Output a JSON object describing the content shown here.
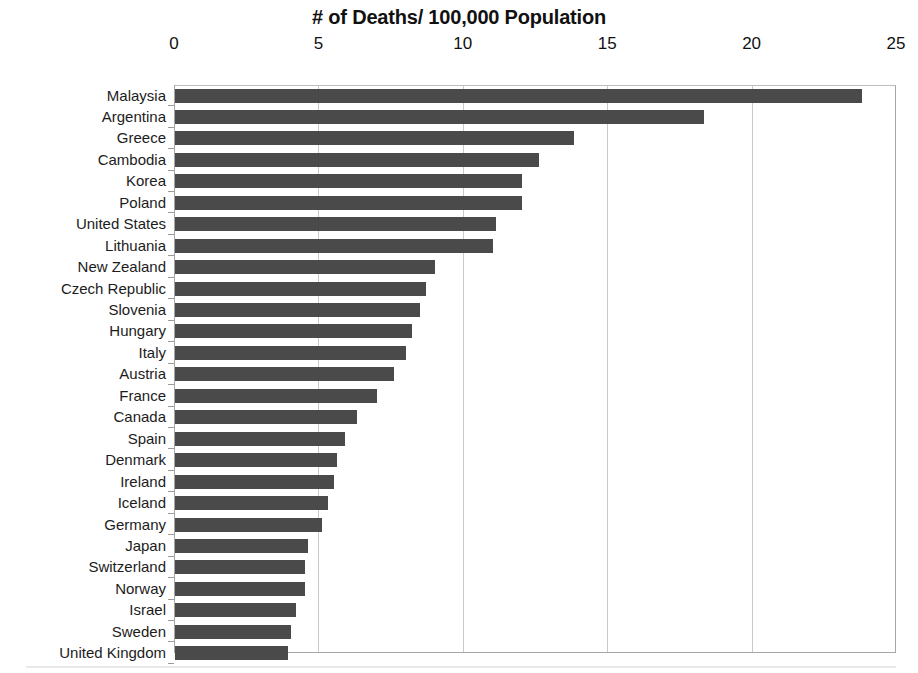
{
  "chart_data": {
    "type": "bar",
    "orientation": "horizontal",
    "title": "# of Deaths/ 100,000 Population",
    "xlabel": "",
    "ylabel": "",
    "xlim": [
      0,
      25
    ],
    "xticks": [
      0,
      5,
      10,
      15,
      20,
      25
    ],
    "xtick_labels": [
      "0",
      "5",
      "10",
      "15",
      "20",
      "25"
    ],
    "grid": true,
    "grid_axis": "x",
    "legend": false,
    "axis_position": "top",
    "bar_color": "#4a4a4a",
    "gridline_color": "#c9c9c9",
    "plot_border_color": "#a6a6a6",
    "categories": [
      "Malaysia",
      "Argentina",
      "Greece",
      "Cambodia",
      "Korea",
      "Poland",
      "United States",
      "Lithuania",
      "New Zealand",
      "Czech Republic",
      "Slovenia",
      "Hungary",
      "Italy",
      "Austria",
      "France",
      "Canada",
      "Spain",
      "Denmark",
      "Ireland",
      "Iceland",
      "Germany",
      "Japan",
      "Switzerland",
      "Norway",
      "Israel",
      "Sweden",
      "United Kingdom"
    ],
    "values": [
      23.8,
      18.3,
      13.8,
      12.6,
      12.0,
      12.0,
      11.1,
      11.0,
      9.0,
      8.7,
      8.5,
      8.2,
      8.0,
      7.6,
      7.0,
      6.3,
      5.9,
      5.6,
      5.5,
      5.3,
      5.1,
      4.6,
      4.5,
      4.5,
      4.2,
      4.0,
      3.9
    ]
  }
}
